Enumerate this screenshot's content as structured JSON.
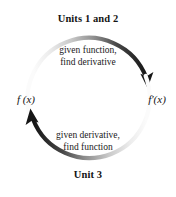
{
  "diagram": {
    "type": "cycle",
    "title_top": "Units 1 and 2",
    "title_bottom": "Unit 3",
    "nodes": {
      "left": "f (x)",
      "right": "f′(x)"
    },
    "arrows": {
      "top": {
        "line1": "given function,",
        "line2": "find derivative",
        "direction": "left-to-right",
        "from": "f (x)",
        "to": "f′(x)",
        "gradient_from": "#f2f2f2",
        "gradient_to": "#1a1a1a"
      },
      "bottom": {
        "line1": "given derivative,",
        "line2": "find function",
        "direction": "right-to-left",
        "from": "f′(x)",
        "to": "f (x)",
        "gradient_from": "#f2f2f2",
        "gradient_to": "#1a1a1a"
      }
    },
    "colors": {
      "background": "#ffffff",
      "text": "#141414",
      "arrow_dark": "#1a1a1a",
      "arrow_light": "#f2f2f2"
    }
  }
}
